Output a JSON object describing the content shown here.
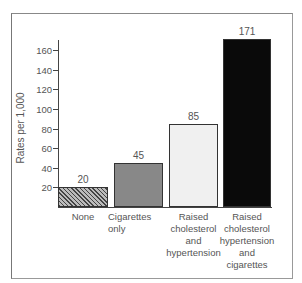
{
  "chart_data": {
    "type": "bar",
    "title": "",
    "xlabel": "",
    "ylabel": "Rates per 1,000",
    "ylim": [
      0,
      170
    ],
    "yticks": [
      20,
      40,
      60,
      80,
      100,
      120,
      140,
      160
    ],
    "grid": false,
    "categories": [
      "None",
      "Cigarettes only",
      "Raised cholesterol and hypertension",
      "Raised cholesterol hypertension and cigarettes"
    ],
    "category_lines": [
      [
        "None"
      ],
      [
        "Cigarettes",
        "only"
      ],
      [
        "Raised",
        "cholesterol",
        "and",
        "hypertension"
      ],
      [
        "Raised",
        "cholesterol",
        "hypertension",
        "and",
        "cigarettes"
      ]
    ],
    "values": [
      20,
      45,
      85,
      171
    ],
    "value_labels": [
      "20",
      "45",
      "85",
      "171"
    ],
    "fills": [
      "hatched",
      "#888888",
      "#f0f0f0",
      "#0a0a0a"
    ]
  }
}
